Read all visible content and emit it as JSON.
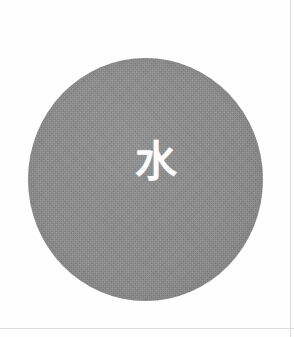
{
  "page": {
    "background_color": "#fefefe",
    "width": 294,
    "height": 337
  },
  "disc": {
    "name": "grey-circle",
    "fill_color": "#8a8a8a",
    "diameter_px": 235
  },
  "glyph": {
    "character": "水",
    "meaning": "water",
    "color": "#fbfbfb"
  },
  "edges": {
    "line_color": "#d9d9d9"
  }
}
